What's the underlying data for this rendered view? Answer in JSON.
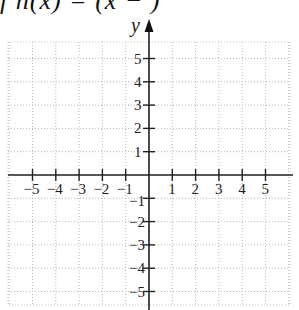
{
  "header": {
    "formula_fragment": "f  h(x)   =   (x  −   )"
  },
  "chart_data": {
    "type": "scatter",
    "title": "",
    "xlabel": "",
    "ylabel": "y",
    "xlim": [
      -6,
      6
    ],
    "ylim": [
      -6,
      6
    ],
    "grid": true,
    "x_ticks": [
      -5,
      -4,
      -3,
      -2,
      -1,
      1,
      2,
      3,
      4,
      5
    ],
    "y_ticks": [
      -5,
      -4,
      -3,
      -2,
      -1,
      1,
      2,
      3,
      4,
      5
    ],
    "x_tick_labels": [
      "−5",
      "−4",
      "−3",
      "−2",
      "−1",
      "1",
      "2",
      "3",
      "4",
      "5"
    ],
    "y_tick_labels": [
      "−5",
      "−4",
      "−3",
      "−2",
      "−1",
      "1",
      "2",
      "3",
      "4",
      "5"
    ],
    "series": []
  }
}
